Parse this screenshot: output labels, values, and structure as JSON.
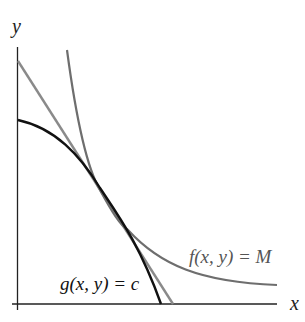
{
  "diagram": {
    "title": "",
    "axes": {
      "x_label": "x",
      "y_label": "y"
    },
    "curves": [
      {
        "id": "f",
        "label": "f(x, y) = M",
        "kind": "level curve (convex)",
        "color": "#6e6e6e"
      },
      {
        "id": "g",
        "label": "g(x, y) = c",
        "kind": "constraint curve (concave)",
        "color": "#111111"
      },
      {
        "id": "tangent",
        "label": "",
        "kind": "tangent line",
        "color": "#8a8a8a"
      }
    ],
    "colors": {
      "axis": "#222222",
      "f_curve": "#6e6e6e",
      "g_curve": "#111111",
      "tangent_line": "#8a8a8a",
      "f_label": "#555555",
      "g_label": "#111111"
    }
  }
}
